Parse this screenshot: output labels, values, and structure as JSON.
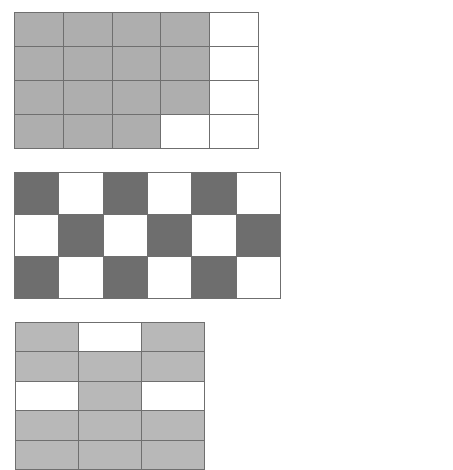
{
  "page": {
    "background_color": "#ffffff",
    "width": 453,
    "height": 457
  },
  "style": {
    "gridline_color": "#6f6f6f",
    "unshaded_color": "#ffffff",
    "gridline_width_px": 1
  },
  "chart_data": {
    "type": "heatmap",
    "xlabel": "",
    "ylabel": "",
    "grid": true,
    "legend": "none",
    "figures": [
      {
        "id": "figure-1",
        "name": "grid-5x4-medium-grey",
        "columns": 5,
        "rows": 4,
        "shaded_color": "#aeaeae",
        "unshaded_color": "#ffffff",
        "shaded_count": 17,
        "total_cells": 20,
        "fraction": "17/20",
        "cells": [
          [
            1,
            1,
            1,
            1,
            0
          ],
          [
            1,
            1,
            1,
            1,
            0
          ],
          [
            1,
            1,
            1,
            1,
            0
          ],
          [
            1,
            1,
            1,
            0,
            0
          ]
        ]
      },
      {
        "id": "figure-2",
        "name": "grid-6x3-dark-grey-checkerboard",
        "columns": 6,
        "rows": 3,
        "shaded_color": "#6e6e6e",
        "unshaded_color": "#ffffff",
        "shaded_count": 9,
        "total_cells": 18,
        "fraction": "9/18",
        "cells": [
          [
            1,
            0,
            1,
            0,
            1,
            0
          ],
          [
            0,
            1,
            0,
            1,
            0,
            1
          ],
          [
            1,
            0,
            1,
            0,
            1,
            0
          ]
        ]
      },
      {
        "id": "figure-3",
        "name": "grid-3x5-light-grey",
        "columns": 3,
        "rows": 5,
        "shaded_color": "#b8b8b8",
        "unshaded_color": "#ffffff",
        "shaded_count": 12,
        "total_cells": 15,
        "fraction": "12/15",
        "cells": [
          [
            1,
            0,
            1
          ],
          [
            1,
            1,
            1
          ],
          [
            0,
            1,
            0
          ],
          [
            1,
            1,
            1
          ],
          [
            1,
            1,
            1
          ]
        ]
      }
    ]
  }
}
